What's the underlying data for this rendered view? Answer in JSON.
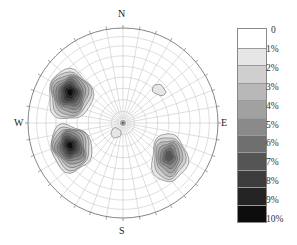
{
  "chart_data": {
    "type": "heatmap",
    "subtype": "stereonet-pole-density-contour",
    "title": "",
    "compass_labels": {
      "north": "N",
      "south": "S",
      "east": "E",
      "west": "W"
    },
    "grid": {
      "radial_interval_deg": 10,
      "concentric_interval_deg": 10,
      "projection": "equal-area lower hemisphere"
    },
    "legend": {
      "position": "right",
      "labels": [
        "0",
        "1%",
        "2%",
        "3%",
        "4%",
        "5%",
        "6%",
        "7%",
        "8%",
        "9%",
        "10%"
      ],
      "colors": [
        "#ffffff",
        "#e6e6e6",
        "#cfcfcf",
        "#b8b8b8",
        "#a1a1a1",
        "#8a8a8a",
        "#6f6f6f",
        "#555555",
        "#3c3c3c",
        "#242424",
        "#0d0d0d"
      ]
    },
    "clusters": [
      {
        "name": "upper-west",
        "cx": 70,
        "cy": 95,
        "rx": 22,
        "ry": 25,
        "rot": 0,
        "peak_level": 10
      },
      {
        "name": "lower-west",
        "cx": 71,
        "cy": 148,
        "rx": 20,
        "ry": 24,
        "rot": -20,
        "peak_level": 10
      },
      {
        "name": "southeast",
        "cx": 169,
        "cy": 158,
        "rx": 18,
        "ry": 24,
        "rot": 0,
        "peak_level": 7
      },
      {
        "name": "northeast-small",
        "cx": 159,
        "cy": 90,
        "rx": 7,
        "ry": 5,
        "rot": 30,
        "peak_level": 1
      },
      {
        "name": "center-small",
        "cx": 116,
        "cy": 133,
        "rx": 5,
        "ry": 5,
        "rot": 0,
        "peak_level": 1
      }
    ]
  }
}
